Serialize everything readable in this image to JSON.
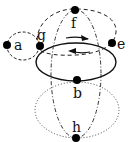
{
  "diagram": {
    "type": "graph-with-cycles",
    "nodes": [
      {
        "id": "a",
        "label": "a",
        "x": 7,
        "y": 45
      },
      {
        "id": "g",
        "label": "g",
        "x": 40,
        "y": 46
      },
      {
        "id": "f",
        "label": "f",
        "x": 75,
        "y": 10
      },
      {
        "id": "e",
        "label": "e",
        "x": 112,
        "y": 44
      },
      {
        "id": "b",
        "label": "b",
        "x": 77,
        "y": 80
      },
      {
        "id": "h",
        "label": "h",
        "x": 76,
        "y": 138
      }
    ],
    "cycles": [
      {
        "name": "solid-ellipse g-e-b",
        "style": "solid"
      },
      {
        "name": "dashed-loop a-g",
        "style": "dashed"
      },
      {
        "name": "dashed-arc g-f-e",
        "style": "dashed"
      },
      {
        "name": "dash-dot-ellipse f-b-h",
        "style": "dash-dot"
      },
      {
        "name": "dotted-loop b-h",
        "style": "dotted"
      }
    ],
    "arrows": [
      {
        "direction": "right",
        "style": "solid"
      },
      {
        "direction": "left",
        "style": "solid"
      }
    ],
    "colors": {
      "stroke": "#111111",
      "node": "#000000",
      "background": "#ffffff"
    }
  }
}
